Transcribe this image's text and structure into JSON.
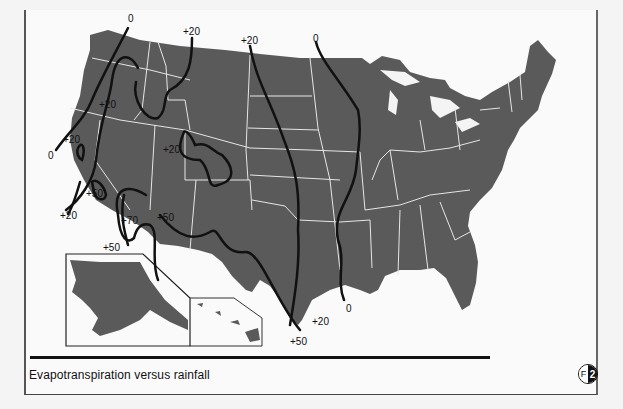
{
  "figure": {
    "caption": "Evapotranspiration versus rainfall",
    "badge": {
      "left": "F",
      "right": "2"
    }
  },
  "map": {
    "region": "Contiguous United States with Alaska and Hawaii insets",
    "land_color": "#5a5a5a",
    "border_color": "#e8e8e8",
    "isoline_color": "#111111",
    "isoline_labels": [
      {
        "id": "nw-zero-top",
        "text": "0"
      },
      {
        "id": "nw-zero-bottom",
        "text": "0"
      },
      {
        "id": "n-plus20",
        "text": "+20"
      },
      {
        "id": "plains-plus20-top",
        "text": "+20"
      },
      {
        "id": "plains-zero-top",
        "text": "0"
      },
      {
        "id": "or-plus20",
        "text": "+20"
      },
      {
        "id": "ca-plus20-coast",
        "text": "+20"
      },
      {
        "id": "co-plus20",
        "text": "+20"
      },
      {
        "id": "ca-plus50",
        "text": "+50"
      },
      {
        "id": "ca-plus20-south",
        "text": "+20"
      },
      {
        "id": "sw-plus70",
        "text": "+70"
      },
      {
        "id": "sw-plus50",
        "text": "+50"
      },
      {
        "id": "sw-plus50-bottom",
        "text": "+50"
      },
      {
        "id": "tx-plus20",
        "text": "+20"
      },
      {
        "id": "la-zero",
        "text": "0"
      },
      {
        "id": "tx-plus50",
        "text": "+50"
      }
    ]
  }
}
